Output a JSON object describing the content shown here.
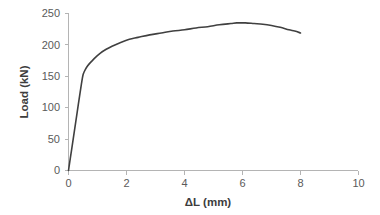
{
  "chart_data": {
    "type": "line",
    "title": "",
    "subtitle": "",
    "xlabel": "ΔL (mm)",
    "ylabel": "Load (kN)",
    "xlim": [
      0,
      10
    ],
    "ylim": [
      0,
      250
    ],
    "xticks": [
      0,
      2,
      4,
      6,
      8,
      10
    ],
    "yticks": [
      0,
      50,
      100,
      150,
      200,
      250
    ],
    "xtick_labels": [
      "0",
      "2",
      "4",
      "6",
      "8",
      "10"
    ],
    "ytick_labels": [
      "0",
      "50",
      "100",
      "150",
      "200",
      "250"
    ],
    "grid": false,
    "legend": false,
    "legend_position": "none",
    "annotations": [],
    "series": [
      {
        "name": "Load-displacement",
        "color": "#404040",
        "x": [
          0.0,
          0.1,
          0.2,
          0.3,
          0.4,
          0.45,
          0.5,
          0.55,
          0.62,
          0.7,
          0.8,
          0.95,
          1.1,
          1.3,
          1.5,
          1.8,
          2.1,
          2.4,
          2.8,
          3.2,
          3.6,
          4.0,
          4.4,
          4.8,
          5.2,
          5.6,
          5.8,
          6.1,
          6.4,
          6.7,
          7.0,
          7.3,
          7.6,
          7.8,
          8.0
        ],
        "y": [
          0,
          31,
          62,
          93,
          124,
          139,
          152,
          158,
          164,
          169,
          174,
          181,
          187,
          193,
          198,
          204,
          209,
          212,
          216,
          219,
          222,
          224,
          227,
          229,
          232,
          234,
          235,
          235,
          234,
          233,
          231,
          228,
          224,
          222,
          219
        ]
      }
    ],
    "peak_point": {
      "x": 5.8,
      "y": 235
    },
    "end_point": {
      "x": 8.0,
      "y": 219
    },
    "yield_point": {
      "x": 0.62,
      "y": 164
    }
  },
  "axes": {
    "x_title": "ΔL (mm)",
    "y_title": "Load (kN)"
  },
  "colors": {
    "series": "#404040",
    "axis": "#b4b4b4",
    "tick_text": "#5a5a5a",
    "title_text": "#3d3d3d",
    "background": "#ffffff"
  }
}
